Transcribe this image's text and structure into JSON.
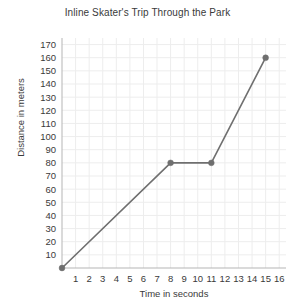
{
  "chart_data": {
    "type": "line",
    "title": "Inline Skater's Trip Through the Park",
    "xlabel": "Time in seconds",
    "ylabel": "Distance in meters",
    "xlim": [
      0,
      16.5
    ],
    "ylim": [
      0,
      175
    ],
    "x_ticks": [
      1,
      2,
      3,
      4,
      5,
      6,
      7,
      8,
      9,
      10,
      11,
      12,
      13,
      14,
      15,
      16
    ],
    "y_ticks": [
      10,
      20,
      30,
      40,
      50,
      60,
      70,
      80,
      90,
      100,
      110,
      120,
      130,
      140,
      150,
      160,
      170
    ],
    "grid": true,
    "legend": "none",
    "series": [
      {
        "name": "Distance traveled",
        "color": "#6f6f6f",
        "marker": "circle",
        "x": [
          0,
          8,
          11,
          15
        ],
        "y": [
          0,
          80,
          80,
          160
        ],
        "points": [
          {
            "x": 0,
            "y": 0
          },
          {
            "x": 8,
            "y": 80
          },
          {
            "x": 11,
            "y": 80
          },
          {
            "x": 15,
            "y": 160
          }
        ]
      }
    ],
    "colors": {
      "line": "#6f6f6f",
      "marker": "#6f6f6f",
      "grid": "#ededed",
      "axis": "#b5b5b5",
      "text": "#3a3a3a",
      "background": "#ffffff"
    }
  }
}
